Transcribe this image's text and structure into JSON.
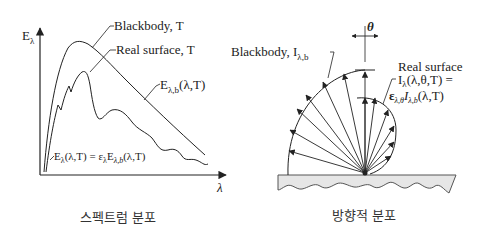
{
  "spectral": {
    "y_axis_label": "E",
    "y_axis_sub": "λ",
    "x_axis_label": "λ",
    "blackbody_label": "Blackbody, T",
    "real_surface_label": "Real surface, T",
    "blackbody_curve_label": "E",
    "blackbody_curve_sub": "λ,b",
    "blackbody_curve_args": "(λ,T)",
    "real_curve_eq": {
      "lhs": "E",
      "lhs_sub": "λ",
      "lhs_args": "(λ,T) = ε",
      "eps_sub": "λ",
      "rhs": "E",
      "rhs_sub": "λ,b",
      "rhs_args": "(λ,T)"
    },
    "caption": "스펙트럼 분포"
  },
  "directional": {
    "theta_label": "θ",
    "blackbody_label": "Blackbody, I",
    "blackbody_sub": "λ,b",
    "real_surface_title": "Real surface",
    "real_eq_line1_main": "I",
    "real_eq_line1_sub": "λ",
    "real_eq_line1_args": "(λ,θ,T) =",
    "real_eq_line2_eps": "ε",
    "real_eq_line2_eps_sub": "λ,θ",
    "real_eq_line2_I": "I",
    "real_eq_line2_I_sub": "λ,b",
    "real_eq_line2_args": "(λ,T)",
    "caption": "방향적 분포"
  },
  "colors": {
    "line": "#222222",
    "surface_fill": "#e6e6e6",
    "surface_stroke": "#555555"
  }
}
